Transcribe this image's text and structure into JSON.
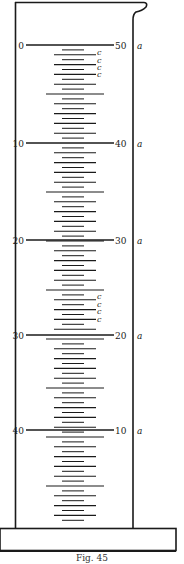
{
  "figure": {
    "caption": "Fig. 45",
    "colors": {
      "ink": "#1a1a1a",
      "paper": "#ffffff"
    }
  },
  "scale": {
    "left_labels": [
      "0",
      "10",
      "20",
      "30",
      "40"
    ],
    "right_labels": [
      "50",
      "40",
      "30",
      "20",
      "10"
    ],
    "right_unit": "a",
    "subdivisions_per_interval": 20,
    "c_marks": {
      "label": "c",
      "groups": [
        {
          "after_label": "0",
          "count": 4
        },
        {
          "before_label": "30",
          "count": 4
        }
      ]
    }
  }
}
